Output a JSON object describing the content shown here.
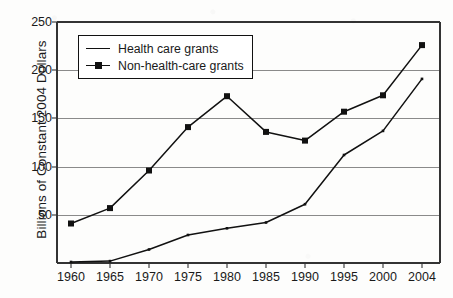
{
  "chart_data": {
    "type": "line",
    "title": "",
    "subtitle": "",
    "xlabel": "",
    "ylabel": "Billions of Constant 2004 Dollars",
    "x": [
      1960,
      1965,
      1970,
      1975,
      1980,
      1985,
      1990,
      1995,
      2000,
      2004
    ],
    "categories": [
      "1960",
      "1965",
      "1970",
      "1975",
      "1980",
      "1985",
      "1990",
      "1995",
      "2000",
      "2004"
    ],
    "series": [
      {
        "name": "Health care grants",
        "marker": "none",
        "values": [
          1,
          2,
          14,
          29,
          36,
          42,
          61,
          112,
          137,
          191
        ]
      },
      {
        "name": "Non-health-care grants",
        "marker": "square",
        "values": [
          41,
          57,
          96,
          141,
          173,
          136,
          127,
          157,
          174,
          226
        ]
      }
    ],
    "ylim": [
      0,
      250
    ],
    "yticks": [
      50,
      100,
      150,
      200,
      250
    ],
    "ytick_labels": [
      "50",
      "100",
      "150",
      "200",
      "250"
    ],
    "xlim": [
      1958,
      2006
    ],
    "grid": "horizontal",
    "legend_position": "upper-left-inside",
    "line_color": "#111111",
    "grid_color": "#8a8a8a",
    "frame_color": "#333333",
    "background_color": "#fdfdfc"
  },
  "legend": {
    "items": [
      {
        "label": "Health care grants",
        "key": "plain-line"
      },
      {
        "label": "Non-health-care grants",
        "key": "line-with-square-marker"
      }
    ]
  },
  "axis": {
    "y_label": "Billions of Constant 2004 Dollars",
    "y_ticks": [
      "250",
      "200",
      "150",
      "100",
      "50"
    ],
    "x_ticks": [
      "1960",
      "1965",
      "1970",
      "1975",
      "1980",
      "1985",
      "1990",
      "1995",
      "2000",
      "2004"
    ]
  }
}
